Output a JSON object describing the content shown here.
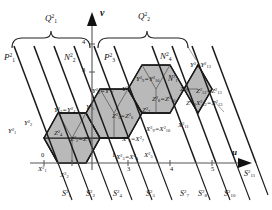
{
  "figure": {
    "type": "lattice-tiling-diagram",
    "axes": {
      "vertical_label": "v",
      "horizontal_label": "u",
      "vertical_ticks": [
        "3",
        "4"
      ],
      "horizontal_ticks": [
        "0",
        "1",
        "3",
        "4",
        "5"
      ]
    },
    "braces": [
      {
        "label_base": "Q",
        "sub": "1",
        "sup": "2"
      },
      {
        "label_base": "Q",
        "sub": "2",
        "sup": "2"
      }
    ],
    "region_labels": [
      {
        "base": "P",
        "sub": "1",
        "sup": "2"
      },
      {
        "base": "N",
        "sub": "2",
        "sup": "2"
      },
      {
        "base": "P",
        "sub": "3",
        "sup": "2"
      },
      {
        "base": "N",
        "sub": "4",
        "sup": "2"
      },
      {
        "base": "N",
        "sub": "1",
        "sup": "2"
      }
    ],
    "y_labels": [
      {
        "text": "Y",
        "sub": "1",
        "sup": "2"
      },
      {
        "text": "Y",
        "sub": "2",
        "sup": "2"
      },
      {
        "text": "Y",
        "sub": "3",
        "sup": "2"
      },
      {
        "text": "Y",
        "sub": "4",
        "sup": "2"
      },
      {
        "text": "Y",
        "sub": "5",
        "sup": "2"
      },
      {
        "text": "Y",
        "sub": "6",
        "sup": "2"
      },
      {
        "text": "Y",
        "sub": "7",
        "sup": "2"
      },
      {
        "text": "Y",
        "sub": "8",
        "sup": "2"
      },
      {
        "text": "Y",
        "sub": "9",
        "sup": "2"
      },
      {
        "text": "Y",
        "sub": "10",
        "sup": "2"
      },
      {
        "text": "Y",
        "sub": "12",
        "sup": "2"
      },
      {
        "text": "Y",
        "sub": "13",
        "sup": "2"
      }
    ],
    "z_labels": [
      {
        "text": "Z",
        "sub": "2",
        "sup": "2"
      },
      {
        "text": "Z",
        "sub": "3",
        "sup": "2"
      },
      {
        "text": "Z",
        "sub": "5",
        "sup": "2"
      },
      {
        "text": "Z",
        "sub": "6",
        "sup": "2"
      },
      {
        "text": "Z",
        "sub": "7",
        "sup": "2"
      },
      {
        "text": "Z",
        "sub": "8",
        "sup": "2"
      },
      {
        "text": "Z",
        "sub": "9",
        "sup": "2"
      },
      {
        "text": "Z",
        "sub": "10",
        "sup": "2"
      },
      {
        "text": "Z",
        "sub": "11",
        "sup": "2"
      },
      {
        "text": "Z",
        "sub": "12",
        "sup": "2"
      },
      {
        "text": "Z",
        "sub": "13",
        "sup": "2"
      }
    ],
    "x_labels": [
      {
        "text": "X",
        "sub": "1",
        "sup": "2"
      },
      {
        "text": "X",
        "sub": "2",
        "sup": "2"
      },
      {
        "text": "X",
        "sub": "3",
        "sup": "2"
      },
      {
        "text": "X",
        "sub": "4",
        "sup": "2"
      },
      {
        "text": "X",
        "sub": "5",
        "sup": "2"
      },
      {
        "text": "X",
        "sub": "6",
        "sup": "2"
      },
      {
        "text": "X",
        "sub": "7",
        "sup": "2"
      },
      {
        "text": "X",
        "sub": "9",
        "sup": "2"
      },
      {
        "text": "X",
        "sub": "10",
        "sup": "2"
      },
      {
        "text": "X",
        "sub": "11",
        "sup": "2"
      },
      {
        "text": "X",
        "sub": "12",
        "sup": "2"
      },
      {
        "text": "X",
        "sub": "13",
        "sup": "2"
      }
    ],
    "s_labels": [
      {
        "text": "S",
        "sub": "1",
        "sup": "2"
      },
      {
        "text": "S",
        "sub": "2",
        "sup": "2"
      },
      {
        "text": "S",
        "sub": "4",
        "sup": "2"
      },
      {
        "text": "S",
        "sub": "5",
        "sup": "2"
      },
      {
        "text": "S",
        "sub": "7",
        "sup": "2"
      },
      {
        "text": "S",
        "sub": "8",
        "sup": "2"
      },
      {
        "text": "S",
        "sub": "10",
        "sup": "2"
      },
      {
        "text": "S",
        "sub": "11",
        "sup": "2"
      }
    ],
    "colors": {
      "line": "#1a1a1a",
      "fill_shaded": "#b9b9b9",
      "axis": "#555555",
      "background": "#ffffff"
    }
  },
  "text": {
    "brace_q1": "Q",
    "brace_q2": "Q",
    "axis_v": "v",
    "axis_u": "u",
    "sup2": "2",
    "p1": "P",
    "n2": "N",
    "p3": "P",
    "n4": "N",
    "n1": "N",
    "eq": "=",
    "tick0": "0",
    "tick1": "1",
    "tick3": "3",
    "tick4": "4",
    "tick5": "5",
    "vtick3": "3",
    "vtick4": "4",
    "Y": "Y",
    "Z": "Z",
    "X": "X",
    "S": "S",
    "Y6_Y7": "Y",
    "Y9_Y10": "Y",
    "Y12_Y13": "Y",
    "Y1": "Y",
    "Y2": "Y",
    "Y3_Y4": "Y",
    "Y5": "Y",
    "Y8": "Y",
    "Z2_Z3": "Z",
    "Z5_Z6": "Z",
    "Z7": "Z",
    "Z8_Z10": "Z",
    "Z9": "Z",
    "Z11": "Z",
    "Z12_Z13": "Z",
    "X1": "X",
    "X2": "X",
    "X3_X4": "X",
    "X5": "X",
    "X6_X7": "X",
    "X9_X10": "X",
    "X11": "X",
    "X12_X13": "X"
  }
}
